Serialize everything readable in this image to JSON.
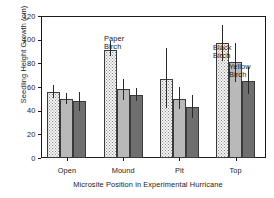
{
  "chart_data": {
    "type": "bar",
    "title": "",
    "subtitle": "",
    "xlabel": "Microsite Position in Experimental Hurricane",
    "ylabel": "Seedling Height Growth (cm)",
    "categories": [
      "Open",
      "Mound",
      "Pit",
      "Top"
    ],
    "ylim": [
      0,
      120
    ],
    "yticks": [
      0,
      20,
      40,
      60,
      80,
      100,
      120
    ],
    "ytick_labels": [
      "0",
      "20",
      "40",
      "60",
      "80",
      "100",
      "120"
    ],
    "grid": false,
    "legend_position": "inline annotations",
    "series": [
      {
        "name": "Paper Birch",
        "fill": "stippled",
        "color": "#f4f4f4",
        "values": [
          56,
          91,
          67,
          97
        ],
        "err_low": [
          51,
          86,
          42,
          82
        ],
        "err_high": [
          62,
          99,
          93,
          112
        ]
      },
      {
        "name": "Black Birch",
        "fill": "light-gray",
        "color": "#b9b9b9",
        "values": [
          50,
          58,
          50,
          81
        ],
        "err_low": [
          46,
          49,
          41,
          64
        ],
        "err_high": [
          55,
          67,
          60,
          97
        ]
      },
      {
        "name": "Yellow Birch",
        "fill": "dark-gray",
        "color": "#6f6f6f",
        "values": [
          48,
          53,
          43,
          65
        ],
        "err_low": [
          40,
          48,
          34,
          54
        ],
        "err_high": [
          56,
          59,
          53,
          77
        ]
      }
    ],
    "annotations": [
      {
        "text_line1": "Paper",
        "text_line2": "Birch",
        "x": 104,
        "y": 35
      },
      {
        "text_line1": "Black",
        "text_line2": "Birch",
        "x": 213,
        "y": 44
      },
      {
        "text_line1": "Yellow",
        "text_line2": "Birch",
        "x": 229,
        "y": 63
      }
    ]
  }
}
